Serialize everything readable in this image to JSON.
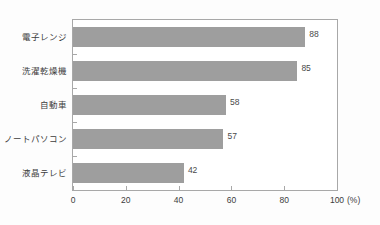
{
  "chart_data": {
    "type": "bar",
    "orientation": "horizontal",
    "title": "",
    "xlabel": "",
    "ylabel": "",
    "unit_label": "(%)",
    "xlim": [
      0,
      100
    ],
    "xticks": [
      0,
      20,
      40,
      60,
      80,
      100
    ],
    "xtick_labels": [
      "0",
      "20",
      "40",
      "60",
      "80",
      "100"
    ],
    "grid": false,
    "legend": false,
    "bar_color": "#9e9e9e",
    "frame_color": "#a8a8a8",
    "categories": [
      "電子レンジ",
      "洗濯乾燥機",
      "自動車",
      "ノートパソコン",
      "液晶テレビ"
    ],
    "values": [
      88,
      85,
      58,
      57,
      42
    ],
    "value_labels": [
      "88",
      "85",
      "58",
      "57",
      "42"
    ]
  }
}
